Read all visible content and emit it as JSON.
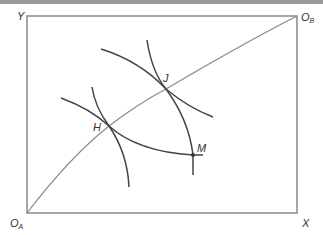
{
  "diagram": {
    "type": "edgeworth-box",
    "labels": {
      "y_axis": "Y",
      "x_axis": "X",
      "origin_a": {
        "main": "O",
        "sub": "A"
      },
      "origin_b": {
        "main": "O",
        "sub": "B"
      },
      "point_j": "J",
      "point_h": "H",
      "point_m": "M"
    },
    "colors": {
      "box": "#777777",
      "contract_curve": "#888888",
      "indifference_curves": "#444444",
      "text": "#333333",
      "top_bar": "#9a9a9a"
    },
    "points": {
      "O_A": [
        27,
        213
      ],
      "O_B": [
        297,
        16
      ],
      "J": [
        166,
        89
      ],
      "H": [
        109,
        126
      ],
      "M": [
        193,
        155
      ]
    }
  }
}
